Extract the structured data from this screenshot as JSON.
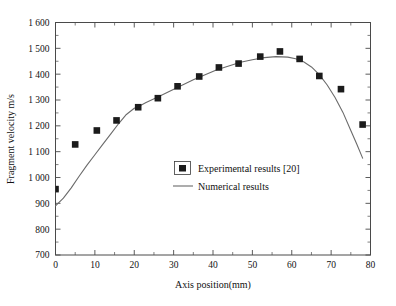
{
  "chart_data": {
    "type": "scatter",
    "title": "",
    "xlabel": "Axis position(mm)",
    "ylabel": "Fragment velocity m/s",
    "xlim": [
      0,
      80
    ],
    "ylim": [
      700,
      1600
    ],
    "grid": false,
    "legend_position": "center",
    "xticks": [
      "0",
      "10",
      "20",
      "30",
      "40",
      "50",
      "60",
      "70",
      "80"
    ],
    "xtick_values": [
      0,
      10,
      20,
      30,
      40,
      50,
      60,
      70,
      80
    ],
    "xminor_values": [
      5,
      15,
      25,
      35,
      45,
      55,
      65,
      75
    ],
    "yticks": [
      "700",
      "800",
      "900",
      "1 000",
      "1 100",
      "1 200",
      "1 300",
      "1 400",
      "1 500",
      "1 600"
    ],
    "ytick_values": [
      700,
      800,
      900,
      1000,
      1100,
      1200,
      1300,
      1400,
      1500,
      1600
    ],
    "yminor_values": [
      750,
      850,
      950,
      1050,
      1150,
      1250,
      1350,
      1450,
      1550
    ],
    "series": [
      {
        "name": "Experimental results [20]",
        "type": "scatter",
        "marker": "square",
        "color": "#1b1b1b",
        "x": [
          0,
          5,
          10.5,
          15.5,
          21,
          26,
          31,
          36.5,
          41.5,
          46.5,
          52,
          57,
          62,
          67,
          72.5,
          78
        ],
        "values": [
          955,
          1128,
          1182,
          1221,
          1272,
          1307,
          1353,
          1391,
          1426,
          1441,
          1468,
          1488,
          1459,
          1393,
          1342,
          1205
        ]
      },
      {
        "name": "Numerical results",
        "type": "line",
        "color": "#6b6b6b",
        "x": [
          0,
          2,
          4,
          6,
          8,
          10,
          12,
          14,
          16,
          18,
          20,
          21,
          23,
          26,
          29,
          32,
          35,
          38,
          41,
          44,
          47,
          50,
          53,
          56,
          59,
          61,
          63,
          65,
          67,
          69,
          71,
          73,
          75,
          76.5,
          78
        ],
        "values": [
          890,
          920,
          960,
          1005,
          1048,
          1088,
          1128,
          1168,
          1208,
          1244,
          1268,
          1274,
          1290,
          1312,
          1334,
          1356,
          1378,
          1398,
          1417,
          1432,
          1446,
          1456,
          1464,
          1468,
          1466,
          1460,
          1448,
          1428,
          1398,
          1358,
          1310,
          1252,
          1182,
          1130,
          1075
        ]
      }
    ],
    "legend": [
      {
        "label": "Experimental results [20]",
        "marker": "square",
        "color": "#1b1b1b"
      },
      {
        "label": "Numerical results",
        "marker": "line",
        "color": "#6b6b6b"
      }
    ]
  }
}
